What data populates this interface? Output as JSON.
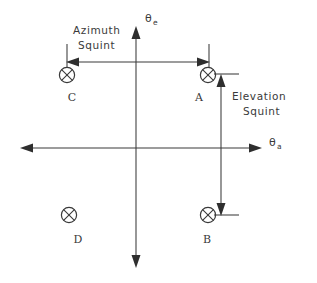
{
  "diagram": {
    "background_color": "#ffffff",
    "stroke_color": "#3a3a3a"
  },
  "axes": {
    "vertical": {
      "label_base": "θ",
      "label_sub": "e",
      "name": "elevation-angle-axis"
    },
    "horizontal": {
      "label_base": "θ",
      "label_sub": "a",
      "name": "azimuth-angle-axis"
    }
  },
  "annotations": {
    "azimuth_squint": {
      "line1": "Azimuth",
      "line2": "Squint"
    },
    "elevation_squint": {
      "line1": "Elevation",
      "line2": "Squint"
    }
  },
  "beam_points": [
    {
      "id": "A",
      "label": "A",
      "quadrant": "upper-right"
    },
    {
      "id": "B",
      "label": "B",
      "quadrant": "lower-right"
    },
    {
      "id": "C",
      "label": "C",
      "quadrant": "upper-left"
    },
    {
      "id": "D",
      "label": "D",
      "quadrant": "lower-left"
    }
  ]
}
